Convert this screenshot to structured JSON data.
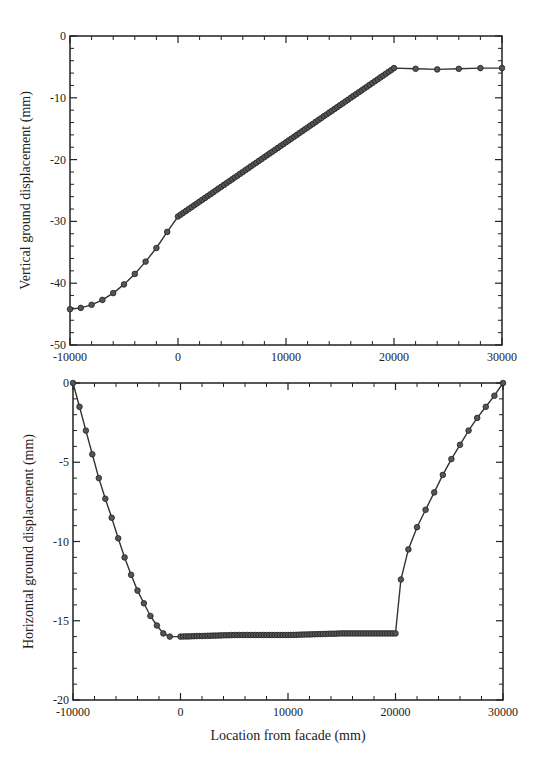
{
  "chart_data": [
    {
      "type": "line",
      "title": "",
      "xlabel": "",
      "ylabel": "Vertical ground displacement (mm)",
      "xlim": [
        -10000,
        30000
      ],
      "ylim": [
        -50,
        0
      ],
      "x_ticks": [
        "-10000",
        "0",
        "10000",
        "20000",
        "30000"
      ],
      "y_ticks": [
        "0",
        "-10",
        "-20",
        "-30",
        "-40",
        "-50"
      ],
      "grid": false,
      "legend": null,
      "marker": "circle",
      "series": [
        {
          "name": "Vertical displacement",
          "x": [
            -10000,
            -9000,
            -8000,
            -7000,
            -6000,
            -5000,
            -4000,
            -3000,
            -2000,
            -1000,
            0,
            5000,
            10000,
            15000,
            20000,
            22000,
            24000,
            26000,
            28000,
            30000
          ],
          "y": [
            -44.2,
            -44.0,
            -43.5,
            -42.7,
            -41.6,
            -40.2,
            -38.5,
            -36.5,
            -34.3,
            -31.7,
            -29.2,
            -23.2,
            -17.2,
            -11.2,
            -5.2,
            -5.3,
            -5.4,
            -5.3,
            -5.2,
            -5.2
          ]
        }
      ]
    },
    {
      "type": "line",
      "title": "",
      "xlabel": "Location from facade (mm)",
      "ylabel": "Horizontal ground displacement (mm)",
      "xlim": [
        -10000,
        30000
      ],
      "ylim": [
        -20,
        0
      ],
      "x_ticks": [
        "-10000",
        "0",
        "10000",
        "20000",
        "30000"
      ],
      "y_ticks": [
        "0",
        "-5",
        "-10",
        "-15",
        "-20"
      ],
      "grid": false,
      "legend": null,
      "marker": "circle",
      "series": [
        {
          "name": "Horizontal displacement",
          "x": [
            -10000,
            -9400,
            -8800,
            -8200,
            -7600,
            -7000,
            -6400,
            -5800,
            -5200,
            -4600,
            -4000,
            -3400,
            -2800,
            -2200,
            -1600,
            -1000,
            0,
            5000,
            10000,
            15000,
            20000,
            20500,
            21200,
            22000,
            22800,
            23600,
            24400,
            25200,
            26000,
            26800,
            27600,
            28400,
            29200,
            30000
          ],
          "y": [
            0,
            -1.5,
            -3.0,
            -4.5,
            -6.0,
            -7.3,
            -8.5,
            -9.8,
            -11.0,
            -12.1,
            -13.1,
            -13.9,
            -14.7,
            -15.3,
            -15.8,
            -16.0,
            -16.0,
            -15.9,
            -15.9,
            -15.8,
            -15.8,
            -12.4,
            -10.5,
            -9.1,
            -8.0,
            -6.9,
            -5.8,
            -4.8,
            -3.9,
            -3.0,
            -2.2,
            -1.5,
            -0.8,
            0
          ]
        }
      ]
    }
  ]
}
